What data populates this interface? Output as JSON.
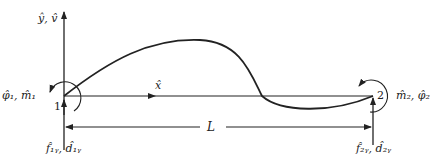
{
  "diagram": {
    "type": "beam-element",
    "axis_label": "ŷ, v̂",
    "x_axis_label": "x̂",
    "length_label": "L",
    "nodes": [
      {
        "id": "1",
        "label": "1",
        "force_label": "f̂₁ᵧ, d̂₁ᵧ",
        "moment_label": "φ̂₁, m̂₁"
      },
      {
        "id": "2",
        "label": "2",
        "force_label": "f̂₂ᵧ, d̂₂ᵧ",
        "moment_label": "m̂₂, φ̂₂"
      }
    ],
    "colors": {
      "line": "#222222",
      "background": "#ffffff"
    }
  },
  "labels": {
    "axis": "ŷ, v̂",
    "x": "x̂",
    "length": "L",
    "node1": "1",
    "node2": "2",
    "node1_force": "f̂₁ᵧ, d̂₁ᵧ",
    "node2_force": "f̂₂ᵧ, d̂₂ᵧ",
    "node1_moment": "φ̂₁, m̂₁",
    "node2_moment": "m̂₂, φ̂₂"
  }
}
